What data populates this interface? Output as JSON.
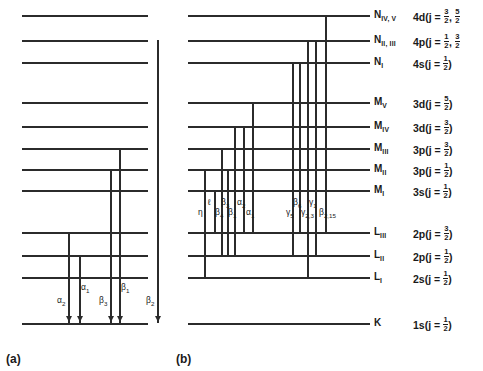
{
  "figure": {
    "type": "energy-level-diagram",
    "panels": [
      {
        "id": "a",
        "caption": "(a)",
        "series": "K-series"
      },
      {
        "id": "b",
        "caption": "(b)",
        "series": "L-series"
      }
    ]
  },
  "levels": [
    {
      "id": "N45",
      "shell": "N",
      "sub": "IV, V",
      "config": "4d",
      "j": "j = 3/2, 5/2",
      "j_clipped": true,
      "y": 15
    },
    {
      "id": "N23",
      "shell": "N",
      "sub": "II, III",
      "config": "4p",
      "j": "j = 1/2, 3/2",
      "j_clipped": true,
      "y": 40
    },
    {
      "id": "N1",
      "shell": "N",
      "sub": "I",
      "config": "4s",
      "j": "j = 1/2",
      "j_clipped": false,
      "y": 62
    },
    {
      "id": "MV",
      "shell": "M",
      "sub": "V",
      "config": "3d",
      "j": "j = 5/2",
      "j_clipped": false,
      "y": 102
    },
    {
      "id": "MIV",
      "shell": "M",
      "sub": "IV",
      "config": "3d",
      "j": "j = 3/2",
      "j_clipped": false,
      "y": 126
    },
    {
      "id": "MIII",
      "shell": "M",
      "sub": "III",
      "config": "3p",
      "j": "j = 3/2",
      "j_clipped": false,
      "y": 148
    },
    {
      "id": "MII",
      "shell": "M",
      "sub": "II",
      "config": "3p",
      "j": "j = 1/2",
      "j_clipped": false,
      "y": 169
    },
    {
      "id": "MI",
      "shell": "M",
      "sub": "I",
      "config": "3s",
      "j": "j = 1/2",
      "j_clipped": false,
      "y": 190
    },
    {
      "id": "LIII",
      "shell": "L",
      "sub": "III",
      "config": "2p",
      "j": "j = 3/2",
      "j_clipped": false,
      "y": 232
    },
    {
      "id": "LII",
      "shell": "L",
      "sub": "II",
      "config": "2p",
      "j": "j = 1/2",
      "j_clipped": false,
      "y": 255
    },
    {
      "id": "LI",
      "shell": "L",
      "sub": "I",
      "config": "2s",
      "j": "j = 1/2",
      "j_clipped": false,
      "y": 277
    },
    {
      "id": "K",
      "shell": "K",
      "sub": "",
      "config": "1s",
      "j": "j = 1/2",
      "j_clipped": false,
      "y": 323
    }
  ],
  "panel_a": {
    "caption": "(a)",
    "line_x_start": 22,
    "line_x_end": 148,
    "transitions": [
      {
        "label": "α",
        "subscript": "2",
        "x": 68,
        "from_y": 232,
        "row": "lower"
      },
      {
        "label": "α",
        "subscript": "1",
        "x": 79,
        "from_y": 255,
        "row": "upper"
      },
      {
        "label": "β",
        "subscript": "3",
        "x": 110,
        "from_y": 169,
        "row": "lower"
      },
      {
        "label": "β",
        "subscript": "1",
        "x": 119,
        "from_y": 148,
        "row": "upper"
      },
      {
        "label": "β",
        "subscript": "2",
        "x": 157,
        "from_y": 40,
        "row": "lower"
      }
    ],
    "arrow_target": "K"
  },
  "panel_b": {
    "caption": "(b)",
    "line_x_start": 188,
    "line_x_end": 370,
    "transitions": [
      {
        "label": "η",
        "subscript": "",
        "x": 204,
        "from_y": 169,
        "to_y": 277,
        "row": "lower"
      },
      {
        "label": "ℓ",
        "subscript": "",
        "x": 214,
        "from_y": 190,
        "to_y": 232,
        "row": "upper"
      },
      {
        "label": "β",
        "subscript": "4",
        "x": 221,
        "from_y": 148,
        "to_y": 255,
        "row": "lower"
      },
      {
        "label": "β",
        "subscript": "3",
        "x": 227,
        "from_y": 169,
        "to_y": 255,
        "row": "upper"
      },
      {
        "label": "β",
        "subscript": "1",
        "x": 234,
        "from_y": 126,
        "to_y": 255,
        "row": "lower"
      },
      {
        "label": "α",
        "subscript": "2",
        "x": 243,
        "from_y": 126,
        "to_y": 232,
        "row": "upper"
      },
      {
        "label": "α",
        "subscript": "1",
        "x": 252,
        "from_y": 102,
        "to_y": 232,
        "row": "lower"
      },
      {
        "label": "γ",
        "subscript": "5",
        "x": 292,
        "from_y": 62,
        "to_y": 255,
        "row": "lower"
      },
      {
        "label": "β",
        "subscript": "6",
        "x": 299,
        "from_y": 62,
        "to_y": 232,
        "row": "upper"
      },
      {
        "label": "γ",
        "subscript": "2,3",
        "x": 307,
        "from_y": 40,
        "to_y": 277,
        "row": "lower"
      },
      {
        "label": "γ",
        "subscript": "1",
        "x": 315,
        "from_y": 40,
        "to_y": 255,
        "row": "upper"
      },
      {
        "label": "β",
        "subscript": "2,15",
        "x": 325,
        "from_y": 15,
        "to_y": 232,
        "row": "lower"
      }
    ],
    "arrow_target": null
  },
  "label_columns": {
    "shell_x": 374,
    "config_x": 413
  }
}
